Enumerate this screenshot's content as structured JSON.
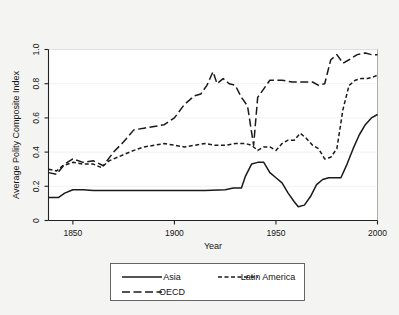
{
  "chart_data": {
    "type": "line",
    "title": "",
    "xlabel": "Year",
    "ylabel": "Average Polity Composite Index",
    "xlim": [
      1838,
      2000
    ],
    "ylim": [
      0,
      1.0
    ],
    "xticks": [
      1850,
      1900,
      1950,
      2000
    ],
    "yticks": [
      0,
      0.2,
      0.4,
      0.6,
      0.8,
      1.0
    ],
    "ytick_labels": [
      "0",
      "0.2",
      "0.4",
      "0.6",
      "0.8",
      "1.0"
    ],
    "xtick_labels": [
      "1850",
      "1900",
      "1950",
      "2000"
    ],
    "grid": true,
    "legend_position": "below-plot",
    "series": [
      {
        "name": "Asia",
        "style": "solid",
        "x": [
          1838,
          1843,
          1846,
          1850,
          1855,
          1860,
          1865,
          1875,
          1885,
          1895,
          1905,
          1915,
          1925,
          1929,
          1931,
          1933,
          1935,
          1938,
          1941,
          1944,
          1947,
          1950,
          1953,
          1956,
          1959,
          1961,
          1964,
          1967,
          1970,
          1973,
          1976,
          1979,
          1982,
          1985,
          1988,
          1991,
          1994,
          1997,
          2000
        ],
        "y": [
          0.135,
          0.135,
          0.16,
          0.18,
          0.18,
          0.175,
          0.175,
          0.175,
          0.175,
          0.175,
          0.175,
          0.175,
          0.18,
          0.19,
          0.19,
          0.19,
          0.26,
          0.33,
          0.34,
          0.34,
          0.28,
          0.25,
          0.22,
          0.16,
          0.11,
          0.08,
          0.09,
          0.14,
          0.21,
          0.24,
          0.25,
          0.25,
          0.25,
          0.33,
          0.42,
          0.5,
          0.56,
          0.6,
          0.62
        ]
      },
      {
        "name": "Latin America",
        "style": "short-dash",
        "x": [
          1838,
          1842,
          1845,
          1850,
          1855,
          1860,
          1864,
          1868,
          1872,
          1876,
          1880,
          1885,
          1890,
          1895,
          1900,
          1905,
          1910,
          1915,
          1920,
          1925,
          1930,
          1935,
          1938,
          1941,
          1944,
          1947,
          1950,
          1953,
          1956,
          1959,
          1962,
          1965,
          1968,
          1971,
          1974,
          1977,
          1980,
          1983,
          1986,
          1989,
          1992,
          1995,
          1998,
          2000
        ],
        "y": [
          0.3,
          0.29,
          0.32,
          0.34,
          0.33,
          0.33,
          0.31,
          0.35,
          0.37,
          0.39,
          0.41,
          0.43,
          0.44,
          0.45,
          0.44,
          0.43,
          0.44,
          0.45,
          0.44,
          0.44,
          0.45,
          0.45,
          0.44,
          0.41,
          0.43,
          0.43,
          0.41,
          0.45,
          0.47,
          0.47,
          0.51,
          0.48,
          0.44,
          0.42,
          0.36,
          0.37,
          0.42,
          0.65,
          0.79,
          0.82,
          0.83,
          0.83,
          0.84,
          0.85
        ]
      },
      {
        "name": "OECD",
        "style": "long-dash",
        "x": [
          1838,
          1842,
          1846,
          1850,
          1855,
          1860,
          1865,
          1870,
          1875,
          1880,
          1885,
          1890,
          1895,
          1900,
          1905,
          1910,
          1913,
          1916,
          1919,
          1921,
          1924,
          1927,
          1930,
          1933,
          1936,
          1939,
          1941,
          1944,
          1947,
          1950,
          1953,
          1958,
          1963,
          1968,
          1971,
          1974,
          1977,
          1980,
          1983,
          1986,
          1990,
          1994,
          1997,
          2000
        ],
        "y": [
          0.28,
          0.27,
          0.33,
          0.36,
          0.34,
          0.35,
          0.32,
          0.4,
          0.46,
          0.53,
          0.54,
          0.55,
          0.56,
          0.6,
          0.68,
          0.73,
          0.74,
          0.79,
          0.87,
          0.8,
          0.83,
          0.8,
          0.79,
          0.72,
          0.67,
          0.44,
          0.72,
          0.77,
          0.82,
          0.82,
          0.82,
          0.81,
          0.81,
          0.81,
          0.79,
          0.8,
          0.94,
          0.97,
          0.92,
          0.94,
          0.97,
          0.98,
          0.97,
          0.97
        ]
      }
    ]
  },
  "legend": {
    "entries": [
      {
        "label": "Asia",
        "style": "solid"
      },
      {
        "label": "Latin America",
        "style": "short-dash"
      },
      {
        "label": "OECD",
        "style": "long-dash"
      }
    ]
  },
  "colors": {
    "line": "#1a1a1a",
    "background": "#f4f4f3",
    "plot_background": "#ffffff",
    "grid": "#ededed",
    "axis": "#222222"
  }
}
